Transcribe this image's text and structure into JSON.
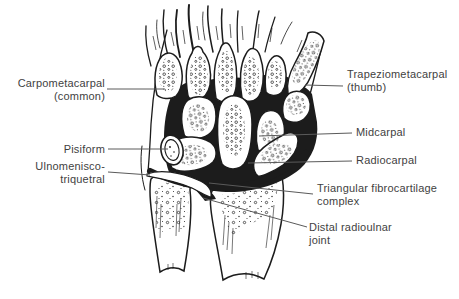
{
  "figure": {
    "type": "anatomical-line-diagram",
    "colors": {
      "background": "#ffffff",
      "ink": "#1c1c1c",
      "label_text": "#3f3f3f",
      "leader_line": "#5a5a5a"
    },
    "labels": {
      "carpometacarpal": {
        "line1": "Carpometacarpal",
        "line2": "(common)"
      },
      "pisiform": {
        "line1": "Pisiform"
      },
      "ulnomeniscotriquetral": {
        "line1": "Ulnomenisco-",
        "line2": "triquetral"
      },
      "trapeziometacarpal": {
        "line1": "Trapeziometacarpal",
        "line2": "(thumb)"
      },
      "midcarpal": {
        "line1": "Midcarpal"
      },
      "radiocarpal": {
        "line1": "Radiocarpal"
      },
      "triangular_fibrocartilage": {
        "line1": "Triangular fibrocartilage",
        "line2": "complex"
      },
      "distal_radioulnar": {
        "line1": "Distal radioulnar",
        "line2": "joint"
      }
    }
  }
}
